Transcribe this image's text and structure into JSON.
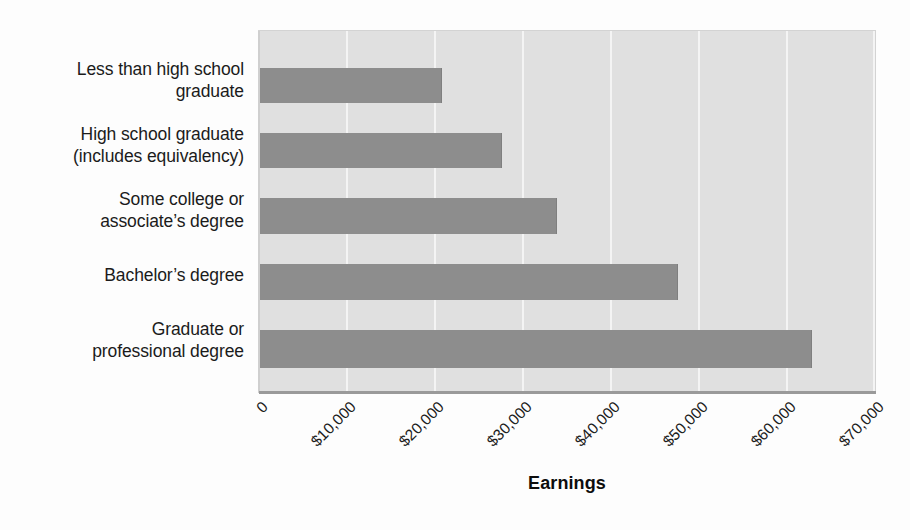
{
  "chart_data": {
    "type": "bar",
    "orientation": "horizontal",
    "title": "",
    "xlabel": "Earnings",
    "ylabel": "",
    "xlim": [
      0,
      70000
    ],
    "ylim": null,
    "grid": true,
    "legend": null,
    "xticks": [
      "0",
      "$10,000",
      "$20,000",
      "$30,000",
      "$40,000",
      "$50,000",
      "$60,000",
      "$70,000"
    ],
    "xtick_values": [
      0,
      10000,
      20000,
      30000,
      40000,
      50000,
      60000,
      70000
    ],
    "categories": [
      "Less than high school graduate",
      "High school graduate (includes equivalency)",
      "Some college or associate's degree",
      "Bachelor's degree",
      "Graduate or professional degree"
    ],
    "category_lines": [
      [
        "Less than high school",
        "graduate"
      ],
      [
        "High school graduate",
        "(includes equivalency)"
      ],
      [
        "Some college or",
        "associate’s degree"
      ],
      [
        "Bachelor’s degree"
      ],
      [
        "Graduate or",
        "professional degree"
      ]
    ],
    "values": [
      20800,
      27600,
      33900,
      47600,
      62800
    ],
    "bar_color": "#8d8d8d",
    "plot_background": "#e0e0e0",
    "gridline_color": "#f4f4f4"
  },
  "axis_title": {
    "text": "Earnings"
  }
}
